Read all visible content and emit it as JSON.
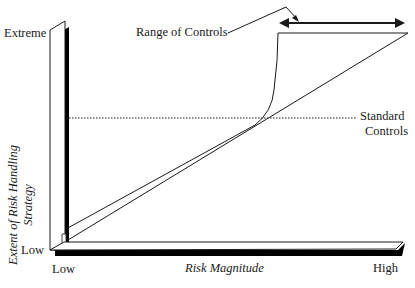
{
  "diagram": {
    "y_axis": {
      "title_line1": "Extent of Risk Handling",
      "title_line2": "Strategy",
      "top_label": "Extreme",
      "bottom_label": "Low"
    },
    "x_axis": {
      "title": "Risk Magnitude",
      "left_label": "Low",
      "right_label": "High"
    },
    "annotations": {
      "range_label": "Range of Controls",
      "standard_line1": "Standard",
      "standard_line2": "Controls"
    },
    "colors": {
      "ink": "#1a1a1a",
      "shadow": "#000000",
      "background": "#ffffff"
    }
  }
}
